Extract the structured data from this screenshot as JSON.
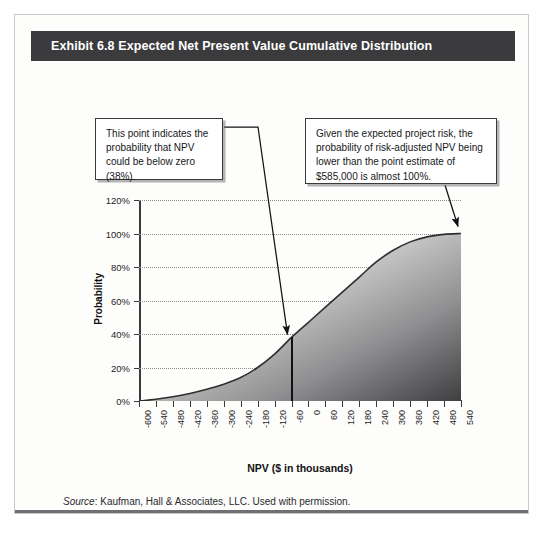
{
  "header": {
    "title": "Exhibit 6.8 Expected Net Present Value Cumulative Distribution"
  },
  "callouts": {
    "left": "This point indicates the probability that NPV could be below zero (38%).",
    "right": "Given the expected project risk, the probability of risk-adjusted NPV being lower than the point estimate of $585,000 is almost 100%."
  },
  "source": {
    "label": "Source",
    "text": ": Kaufman, Hall & Associates, LLC. Used with permission."
  },
  "chart_data": {
    "type": "area",
    "title": "Exhibit 6.8 Expected Net Present Value Cumulative Distribution",
    "xlabel": "NPV ($ in thousands)",
    "ylabel": "Probability",
    "xlim": [
      -600,
      540
    ],
    "ylim": [
      0,
      120
    ],
    "grid": true,
    "legend": "none",
    "ytick_labels": [
      "0%",
      "20%",
      "40%",
      "60%",
      "80%",
      "100%",
      "120%"
    ],
    "ytick_values": [
      0,
      20,
      40,
      60,
      80,
      100,
      120
    ],
    "xtick_labels": [
      "-600",
      "-540",
      "-480",
      "-420",
      "-360",
      "-300",
      "-240",
      "-180",
      "-120",
      "-60",
      "0",
      "60",
      "120",
      "180",
      "240",
      "300",
      "360",
      "420",
      "480",
      "540"
    ],
    "x": [
      -600,
      -540,
      -480,
      -420,
      -360,
      -300,
      -240,
      -180,
      -120,
      -60,
      0,
      60,
      120,
      180,
      240,
      300,
      360,
      420,
      480,
      540
    ],
    "values": [
      0,
      1,
      2.5,
      4.5,
      7,
      10,
      14,
      20,
      28,
      38,
      47,
      56,
      65,
      74,
      83,
      90,
      95,
      98,
      99.5,
      100
    ],
    "series_name": "Cumulative probability",
    "annotations": [
      {
        "name": "below-zero-point",
        "x": -60,
        "y": 38,
        "label": "38%"
      },
      {
        "name": "point-estimate",
        "x": 540,
        "y": 100,
        "label": "almost 100%"
      }
    ]
  },
  "colors": {
    "header_bg": "#3b3b3d",
    "header_text": "#ffffff",
    "page_bg": "#fdfdfc",
    "curve": "#2e2e2e",
    "fill_dark": "#4b4b4e",
    "fill_light": "#e3e3e2",
    "grid": "#8d8d8d"
  }
}
